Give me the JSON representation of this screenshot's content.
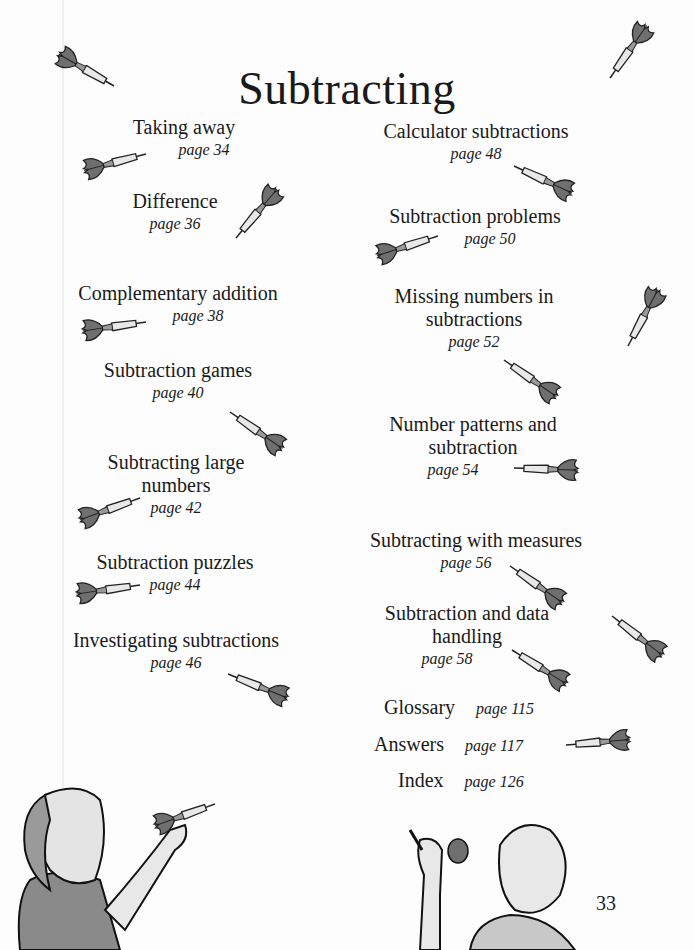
{
  "title": "Subtracting",
  "left_column": [
    {
      "title": "Taking away",
      "page": "page 34"
    },
    {
      "title": "Difference",
      "page": "page 36"
    },
    {
      "title": "Complementary addition",
      "page": "page 38"
    },
    {
      "title": "Subtraction games",
      "page": "page 40"
    },
    {
      "title": "Subtracting large numbers",
      "title_lines": [
        "Subtracting large",
        "numbers"
      ],
      "page": "page 42"
    },
    {
      "title": "Subtraction puzzles",
      "page": "page 44"
    },
    {
      "title": "Investigating subtractions",
      "page": "page 46"
    }
  ],
  "right_column": [
    {
      "title": "Calculator subtractions",
      "page": "page 48"
    },
    {
      "title": "Subtraction problems",
      "page": "page 50"
    },
    {
      "title": "Missing numbers in subtractions",
      "title_lines": [
        "Missing numbers in",
        "subtractions"
      ],
      "page": "page 52"
    },
    {
      "title": "Number patterns and subtraction",
      "title_lines": [
        "Number patterns and",
        "subtraction"
      ],
      "page": "page 54"
    },
    {
      "title": "Subtracting with measures",
      "page": "page 56"
    },
    {
      "title": "Subtraction and data handling",
      "title_lines": [
        "Subtraction and data",
        "handling"
      ],
      "page": "page 58"
    }
  ],
  "back_matter": [
    {
      "title": "Glossary",
      "page": "page 115"
    },
    {
      "title": "Answers",
      "page": "page 117"
    },
    {
      "title": "Index",
      "page": "page 126"
    }
  ],
  "page_number": "33",
  "illustrations": [
    "dart",
    "girl-throwing-dart",
    "boy-holding-dart"
  ]
}
